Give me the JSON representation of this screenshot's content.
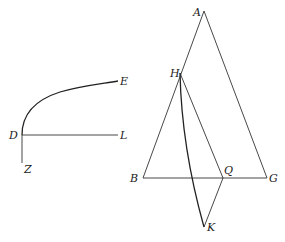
{
  "figure_left": {
    "points": {
      "D": {
        "label": "D",
        "x": 22,
        "y": 135
      },
      "E": {
        "label": "E",
        "x": 118,
        "y": 81
      },
      "L": {
        "label": "L",
        "x": 118,
        "y": 135
      },
      "Z": {
        "label": "Z",
        "x": 22,
        "y": 163
      }
    },
    "segments": [
      "DL",
      "DZ"
    ],
    "curves": [
      "DE"
    ]
  },
  "figure_right": {
    "points": {
      "A": {
        "label": "A",
        "x": 204,
        "y": 11
      },
      "B": {
        "label": "B",
        "x": 143,
        "y": 178
      },
      "G": {
        "label": "G",
        "x": 267,
        "y": 178
      },
      "H": {
        "label": "H",
        "x": 180,
        "y": 73
      },
      "Q": {
        "label": "Q",
        "x": 223,
        "y": 178
      },
      "K": {
        "label": "K",
        "x": 204,
        "y": 227
      }
    },
    "segments": [
      "AB",
      "AG",
      "BG",
      "HQ",
      "QK"
    ],
    "curves": [
      "HK"
    ]
  },
  "colors": {
    "stroke": "#333333",
    "label": "#222222",
    "background": "#ffffff"
  }
}
